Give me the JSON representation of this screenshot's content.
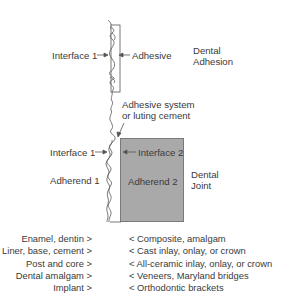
{
  "diagram": {
    "labels": {
      "interface1_top": "Interface 1",
      "adhesive": "Adhesive",
      "dental_adhesion_line1": "Dental",
      "dental_adhesion_line2": "Adhesion",
      "adhesive_system_line1": "Adhesive system",
      "adhesive_system_line2": "or luting cement",
      "interface1_bottom": "Interface 1",
      "interface2": "Interface 2",
      "adherend1": "Adherend 1",
      "adherend2": "Adherend 2",
      "dental_joint_line1": "Dental",
      "dental_joint_line2": "Joint"
    },
    "colors": {
      "adherend2_fill": "#a9a9a9",
      "adherend2_border": "#7a7a7a",
      "line": "#555555"
    }
  },
  "lists": {
    "left": [
      "Enamel, dentin >",
      "Liner, base, cement >",
      "Post and core >",
      "Dental amalgam >",
      "Implant >"
    ],
    "right": [
      "< Composite, amalgam",
      "< Cast inlay, onlay, or crown",
      "< All-ceramic inlay, onlay, or crown",
      "< Veneers, Maryland bridges",
      "< Orthodontic brackets"
    ]
  }
}
